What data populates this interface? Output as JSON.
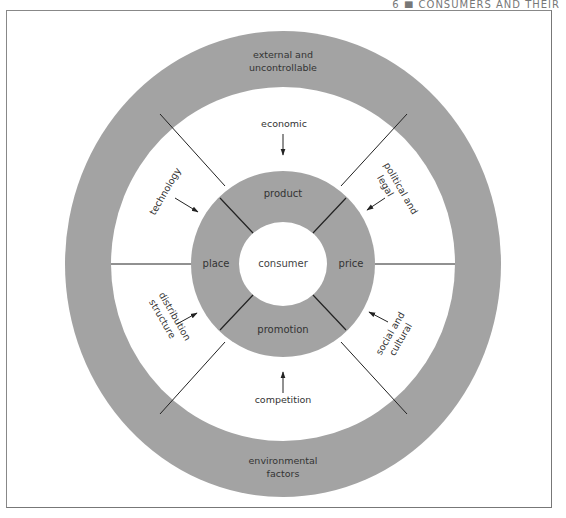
{
  "page_header": "6 ■ CONSUMERS AND THEIR",
  "diagram": {
    "center": "consumer",
    "marketing_mix": {
      "top": "product",
      "left": "place",
      "right": "price",
      "bottom": "promotion"
    },
    "environment_ring": {
      "top_label_line1": "external and",
      "top_label_line2": "uncontrollable",
      "bottom_label_line1": "environmental",
      "bottom_label_line2": "factors"
    },
    "factors": {
      "economic": "economic",
      "political_line1": "political and",
      "political_line2": "legal",
      "social_line1": "social and",
      "social_line2": "cultural",
      "competition": "competition",
      "distribution_line1": "distribution",
      "distribution_line2": "structure",
      "technology": "technology"
    },
    "colors": {
      "ring_fill": "#a3a3a3",
      "background": "#ffffff",
      "line": "#222222",
      "text": "#333333"
    }
  }
}
